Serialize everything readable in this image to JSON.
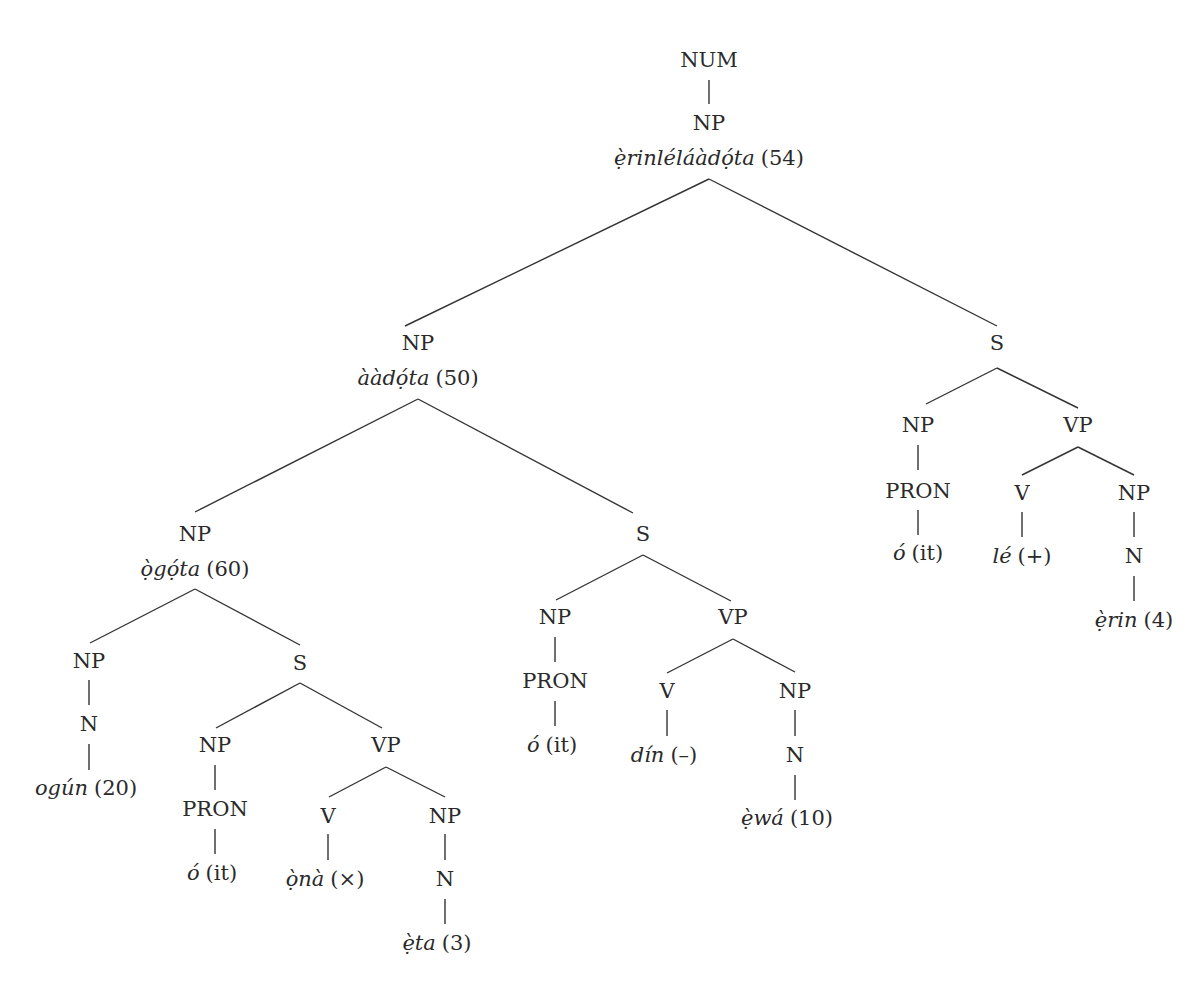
{
  "diagram": {
    "type": "syntax-tree",
    "root": "NUM",
    "nodes": {
      "num": "NUM",
      "np_root": "NP",
      "np_root_word": "ẹ̀rinléláàdọ́ta",
      "np_root_gloss": "(54)",
      "np_left": "NP",
      "np_left_word": "ààdọ́ta",
      "np_left_gloss": "(50)",
      "s_right": "S",
      "s_right_np": "NP",
      "s_right_pron": "PRON",
      "s_right_pron_word": "ó",
      "s_right_pron_gloss": "(it)",
      "s_right_vp": "VP",
      "s_right_v": "V",
      "s_right_v_word": "lé",
      "s_right_v_gloss": "(+)",
      "s_right_obj_np": "NP",
      "s_right_n": "N",
      "s_right_n_word": "ẹ̀rin",
      "s_right_n_gloss": "(4)",
      "np_ogota": "NP",
      "np_ogota_word": "ọ̀gọ́ta",
      "np_ogota_gloss": "(60)",
      "s_mid": "S",
      "s_mid_np": "NP",
      "s_mid_pron": "PRON",
      "s_mid_pron_word": "ó",
      "s_mid_pron_gloss": "(it)",
      "s_mid_vp": "VP",
      "s_mid_v": "V",
      "s_mid_v_word": "dín",
      "s_mid_v_gloss": "(–)",
      "s_mid_obj_np": "NP",
      "s_mid_n": "N",
      "s_mid_n_word": "ẹ̀wá",
      "s_mid_n_gloss": "(10)",
      "np_ogun": "NP",
      "np_ogun_n": "N",
      "np_ogun_word": "ogún",
      "np_ogun_gloss": "(20)",
      "s_low": "S",
      "s_low_np": "NP",
      "s_low_pron": "PRON",
      "s_low_pron_word": "ó",
      "s_low_pron_gloss": "(it)",
      "s_low_vp": "VP",
      "s_low_v": "V",
      "s_low_v_word": "ọ̀nà",
      "s_low_v_gloss": "(×)",
      "s_low_obj_np": "NP",
      "s_low_n": "N",
      "s_low_n_word": "ẹ̀ta",
      "s_low_n_gloss": "(3)"
    }
  }
}
